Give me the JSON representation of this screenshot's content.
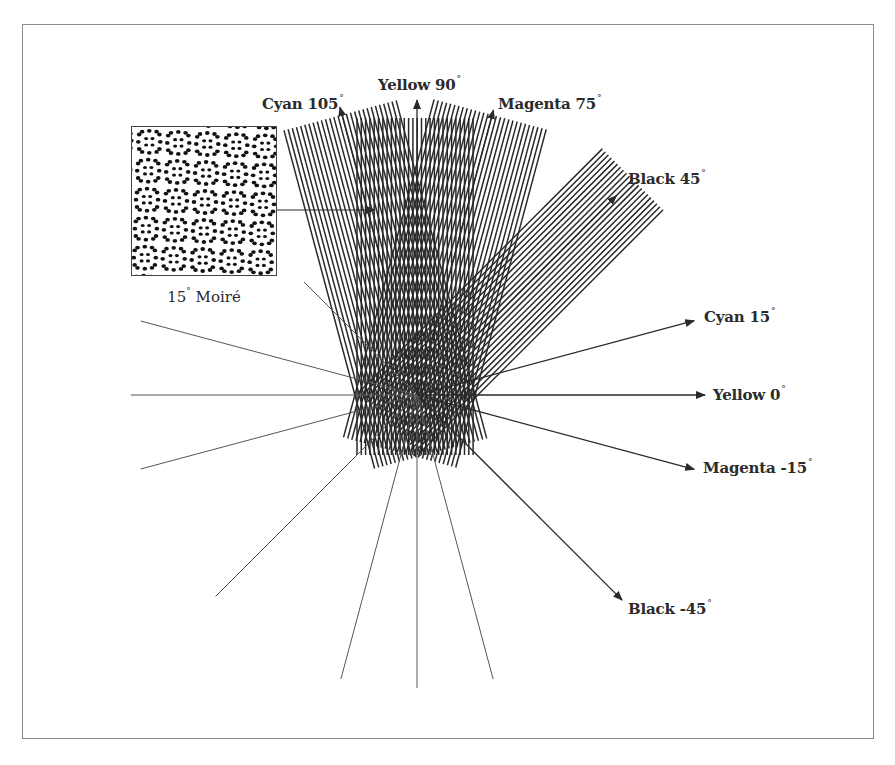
{
  "figure": {
    "type": "halftone screen angle diagram",
    "colors": {
      "line": "#2a2a2a",
      "ray": "#555555",
      "text": "#2b2b2b",
      "frame": "#8a8a8a"
    },
    "center": {
      "x": 417,
      "y": 395
    },
    "bands": [
      {
        "name": "cyan-105",
        "angle": 105,
        "start": -60,
        "end": 290,
        "half_width": 60,
        "spacing": 4.3
      },
      {
        "name": "yellow-90",
        "angle": 90,
        "start": -60,
        "end": 277,
        "half_width": 60,
        "spacing": 4.3
      },
      {
        "name": "magenta-75",
        "angle": 75,
        "start": -60,
        "end": 290,
        "half_width": 60,
        "spacing": 4.3
      },
      {
        "name": "black-45",
        "angle": 45,
        "start": -40,
        "end": 305,
        "half_width": 43,
        "spacing": 4.3
      }
    ],
    "rays": [
      {
        "angle": 105,
        "from": 0,
        "to": 298,
        "arrow": true
      },
      {
        "angle": 90,
        "from": 0,
        "to": 295,
        "arrow": true
      },
      {
        "angle": 75,
        "from": 0,
        "to": 295,
        "arrow": true
      },
      {
        "angle": 45,
        "from": 0,
        "to": 282,
        "arrow": true
      },
      {
        "angle": 15,
        "from": 0,
        "to": 287,
        "arrow": true
      },
      {
        "angle": 0,
        "from": 0,
        "to": 288,
        "arrow": true
      },
      {
        "angle": -15,
        "from": 0,
        "to": 287,
        "arrow": true
      },
      {
        "angle": -45,
        "from": 0,
        "to": 290,
        "arrow": true
      },
      {
        "angle": 135,
        "from": 0,
        "to": 160,
        "arrow": false
      },
      {
        "angle": 165,
        "from": 0,
        "to": 286,
        "arrow": false
      },
      {
        "angle": 180,
        "from": 0,
        "to": 286,
        "arrow": false
      },
      {
        "angle": 195,
        "from": 0,
        "to": 286,
        "arrow": false
      },
      {
        "angle": 225,
        "from": 0,
        "to": 285,
        "arrow": false
      },
      {
        "angle": 255,
        "from": 0,
        "to": 294,
        "arrow": false
      },
      {
        "angle": 270,
        "from": 0,
        "to": 293,
        "arrow": false
      },
      {
        "angle": 285,
        "from": 0,
        "to": 294,
        "arrow": false
      }
    ],
    "pointer_arrow": {
      "x1": 277,
      "y1": 210,
      "x2": 375,
      "y2": 210
    },
    "labels": [
      {
        "id": "cyan-105",
        "text": "Cyan 105",
        "deg": "°",
        "x": 262,
        "y": 93
      },
      {
        "id": "yellow-90",
        "text": "Yellow 90",
        "deg": "°",
        "x": 378,
        "y": 74
      },
      {
        "id": "magenta-75",
        "text": "Magenta 75",
        "deg": "°",
        "x": 498,
        "y": 93
      },
      {
        "id": "black-45",
        "text": "Black 45",
        "deg": "°",
        "x": 628,
        "y": 168
      },
      {
        "id": "cyan-15",
        "text": "Cyan 15",
        "deg": "°",
        "x": 704,
        "y": 306
      },
      {
        "id": "yellow-0",
        "text": "Yellow 0",
        "deg": "°",
        "x": 713,
        "y": 384
      },
      {
        "id": "magenta-neg15",
        "text": "Magenta -15",
        "deg": "°",
        "x": 703,
        "y": 457
      },
      {
        "id": "black-neg45",
        "text": "Black -45",
        "deg": "°",
        "x": 628,
        "y": 598
      }
    ],
    "inset": {
      "caption": "15",
      "caption_deg": "°",
      "caption_suffix": " Moiré",
      "cell": 29,
      "dot_pitch": 7.2,
      "rotation": 15
    }
  }
}
